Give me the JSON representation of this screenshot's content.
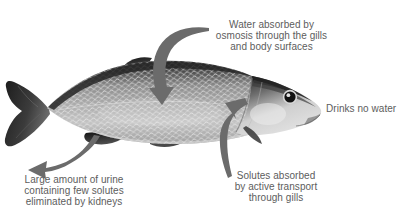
{
  "figure": {
    "background_color": "#ffffff",
    "text_color": "#5d5d5d",
    "arrow_color": "#6b6b6b"
  },
  "callouts": [
    {
      "id": "water-absorbed",
      "text": "Water absorbed by\nosmosis through the gills\nand body surfaces",
      "align": "center"
    },
    {
      "id": "drinks-no-water",
      "text": "Drinks no water",
      "align": "left"
    },
    {
      "id": "solutes-absorbed",
      "text": "Solutes absorbed\nby active transport\nthrough gills",
      "align": "center"
    },
    {
      "id": "urine-eliminated",
      "text": "Large amount of urine\ncontaining few solutes\neliminated by kidneys",
      "align": "center"
    }
  ],
  "arrows": [
    {
      "id": "water-in-arrow",
      "points_to": "dorsal-body",
      "direction": "down"
    },
    {
      "id": "solutes-in-arrow",
      "points_to": "gill-cover",
      "direction": "up-left"
    },
    {
      "id": "urine-out-arrow",
      "points_to": "away-from-vent",
      "direction": "left"
    }
  ],
  "fish": {
    "label": "fish-photograph",
    "body_color": "#9a9a9a",
    "dorsal_color": "#3a3a3a",
    "belly_color": "#d8d8d8",
    "fin_color": "#2b2b2b",
    "eye_color": "#1a1a1a"
  }
}
